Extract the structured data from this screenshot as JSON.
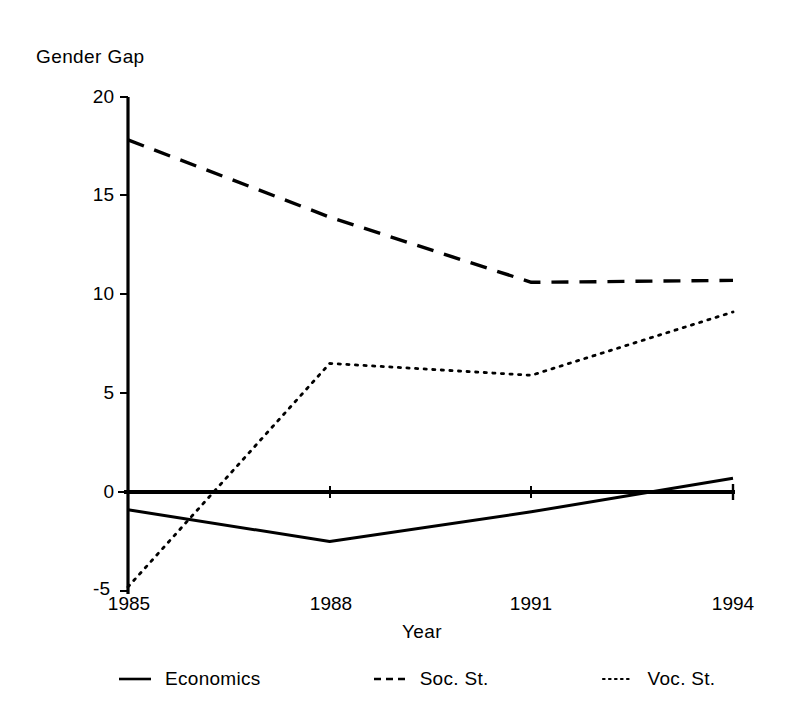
{
  "chart_data": {
    "type": "line",
    "title": "",
    "ylabel": "Gender Gap",
    "xlabel": "Year",
    "x": [
      1985,
      1988,
      1991,
      1994
    ],
    "categories": [
      "1985",
      "1988",
      "1991",
      "1994"
    ],
    "xticklabels": [
      "1985",
      "1988",
      "1991",
      "1994"
    ],
    "yticklabels": [
      "-5",
      "0",
      "5",
      "10",
      "15",
      "20"
    ],
    "yticks": [
      -5,
      0,
      5,
      10,
      15,
      20
    ],
    "ylim": [
      -5,
      20
    ],
    "xlim": [
      1985,
      1994
    ],
    "grid": false,
    "legend_position": "below-axis",
    "zero_reference_line": true,
    "series": [
      {
        "name": "Economics",
        "style": "solid",
        "color": "#000000",
        "values": [
          -0.9,
          -2.5,
          -1.0,
          0.7
        ]
      },
      {
        "name": "Soc. St.",
        "style": "dashed",
        "color": "#000000",
        "values": [
          17.8,
          13.9,
          10.6,
          10.7
        ]
      },
      {
        "name": "Voc. St.",
        "style": "dotted",
        "color": "#000000",
        "values": [
          -4.8,
          6.5,
          5.9,
          9.1
        ]
      }
    ]
  },
  "axes": {
    "y_axis_title": "Gender Gap",
    "x_axis_title": "Year"
  },
  "legend": {
    "entries": [
      {
        "label": "Economics",
        "style": "solid"
      },
      {
        "label": "Soc. St.",
        "style": "dashed"
      },
      {
        "label": "Voc. St.",
        "style": "dotted"
      }
    ]
  },
  "colors": {
    "ink": "#000000",
    "background": "#ffffff"
  }
}
